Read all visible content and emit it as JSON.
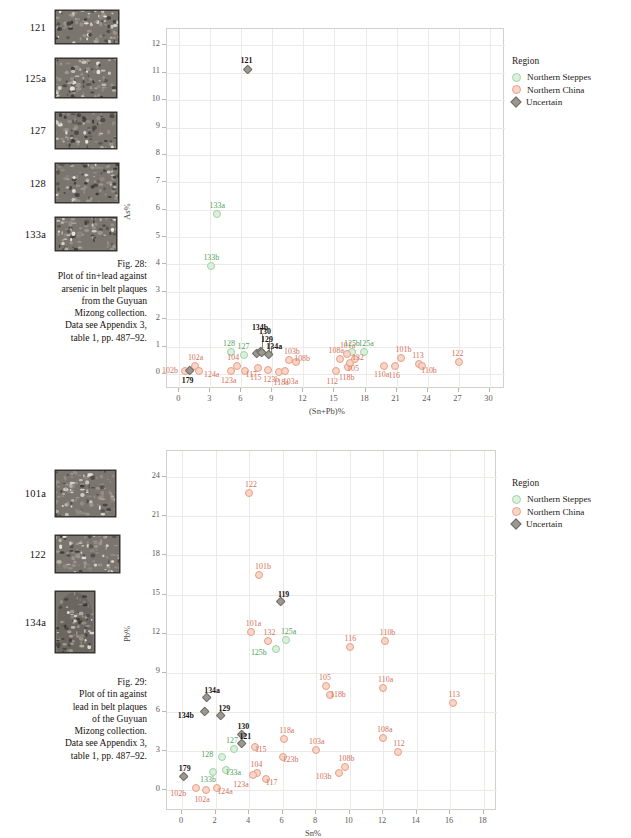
{
  "figures": [
    {
      "id": "fig28",
      "plaques": [
        {
          "id": "121",
          "w": 64,
          "h": 34,
          "shape": "rect"
        },
        {
          "id": "125a",
          "w": 62,
          "h": 40,
          "shape": "rect"
        },
        {
          "id": "127",
          "w": 62,
          "h": 37,
          "shape": "rect"
        },
        {
          "id": "128",
          "w": 64,
          "h": 40,
          "shape": "rect"
        },
        {
          "id": "133a",
          "w": 62,
          "h": 34,
          "shape": "rect"
        }
      ],
      "caption": [
        "Fig. 28:",
        "Plot of tin+lead against",
        "arsenic in belt plaques",
        "from the Guyuan",
        "Mizong collection.",
        "Data see Appendix 3,",
        "table 1, pp. 487–92."
      ],
      "legend": {
        "title": "Region",
        "items": [
          {
            "label": "Northern Steppes",
            "color": "#dcf0dd",
            "border": "#9ed4a5",
            "shape": "circle"
          },
          {
            "label": "Northern China",
            "color": "#f7d5c9",
            "border": "#ea9f85",
            "shape": "circle"
          },
          {
            "label": "Uncertain",
            "color": "#9b9892",
            "border": "#6e6b66",
            "shape": "diamond"
          }
        ]
      },
      "chart_data": {
        "type": "scatter",
        "title": "",
        "xlabel": "(Sn+Pb)%",
        "ylabel": "As%",
        "xlim": [
          -1.2,
          31.5
        ],
        "ylim": [
          -0.55,
          12.6
        ],
        "xticks": [
          0,
          3,
          6,
          9,
          12,
          15,
          18,
          21,
          24,
          27,
          30
        ],
        "yticks": [
          0,
          1,
          2,
          3,
          4,
          5,
          6,
          7,
          8,
          9,
          10,
          11,
          12
        ],
        "grid": true,
        "legend_position": "right",
        "series": [
          {
            "name": "Northern Steppes",
            "color": "#dcf0dd",
            "marker": "circle",
            "points": [
              {
                "label": "133a",
                "x": 3.6,
                "y": 5.85,
                "lx": 0,
                "ly": -10
              },
              {
                "label": "133b",
                "x": 3.1,
                "y": 3.95,
                "lx": -1,
                "ly": -10
              },
              {
                "label": "128",
                "x": 5.0,
                "y": 0.82,
                "lx": -1,
                "ly": -10
              },
              {
                "label": "127",
                "x": 6.2,
                "y": 0.7,
                "lx": 1,
                "ly": -10
              },
              {
                "label": "125b",
                "x": 16.7,
                "y": 0.8,
                "lx": -1,
                "ly": -10
              },
              {
                "label": "125a",
                "x": 17.9,
                "y": 0.82,
                "lx": 1,
                "ly": -10
              }
            ]
          },
          {
            "name": "Northern China",
            "color": "#f7d5c9",
            "marker": "circle",
            "points": [
              {
                "label": "102b",
                "x": 0.55,
                "y": 0.12,
                "lx": -16,
                "ly": -2
              },
              {
                "label": "102a",
                "x": 1.5,
                "y": 0.3,
                "lx": 0,
                "ly": -10
              },
              {
                "label": "124a",
                "x": 1.9,
                "y": 0.12,
                "lx": 12,
                "ly": 2
              },
              {
                "label": "123a",
                "x": 5.0,
                "y": 0.1,
                "lx": -3,
                "ly": 8
              },
              {
                "label": "104",
                "x": 5.6,
                "y": 0.3,
                "lx": -3,
                "ly": -10
              },
              {
                "label": "117",
                "x": 6.3,
                "y": 0.12,
                "lx": 8,
                "ly": 2
              },
              {
                "label": "115",
                "x": 7.6,
                "y": 0.22,
                "lx": -1,
                "ly": 8
              },
              {
                "label": "123b",
                "x": 8.6,
                "y": 0.16,
                "lx": 2,
                "ly": 8
              },
              {
                "label": "118a",
                "x": 9.6,
                "y": 0.06,
                "lx": 2,
                "ly": 9
              },
              {
                "label": "103a",
                "x": 10.2,
                "y": 0.12,
                "lx": 5,
                "ly": 9
              },
              {
                "label": "103b",
                "x": 10.6,
                "y": 0.52,
                "lx": 2,
                "ly": -10
              },
              {
                "label": "108b",
                "x": 11.3,
                "y": 0.42,
                "lx": 5,
                "ly": -5
              },
              {
                "label": "112",
                "x": 15.1,
                "y": 0.1,
                "lx": -2,
                "ly": 9
              },
              {
                "label": "108a",
                "x": 15.5,
                "y": 0.55,
                "lx": -4,
                "ly": -10
              },
              {
                "label": "101a",
                "x": 16.2,
                "y": 0.72,
                "lx": 0,
                "ly": -10
              },
              {
                "label": "118b",
                "x": 16.3,
                "y": 0.25,
                "lx": -2,
                "ly": 9
              },
              {
                "label": "105",
                "x": 16.5,
                "y": 0.4,
                "lx": 4,
                "ly": 4
              },
              {
                "label": "132",
                "x": 17.0,
                "y": 0.55,
                "lx": 4,
                "ly": -3
              },
              {
                "label": "110a",
                "x": 19.8,
                "y": 0.3,
                "lx": -3,
                "ly": 7
              },
              {
                "label": "116",
                "x": 20.9,
                "y": 0.28,
                "lx": 0,
                "ly": 8
              },
              {
                "label": "101b",
                "x": 21.4,
                "y": 0.6,
                "lx": 2,
                "ly": -10
              },
              {
                "label": "113",
                "x": 23.2,
                "y": 0.38,
                "lx": 0,
                "ly": -10
              },
              {
                "label": "110b",
                "x": 23.5,
                "y": 0.3,
                "lx": 6,
                "ly": 3
              },
              {
                "label": "122",
                "x": 27.0,
                "y": 0.45,
                "lx": 0,
                "ly": -10
              }
            ]
          },
          {
            "name": "Uncertain",
            "color": "#9b9892",
            "marker": "diamond",
            "points": [
              {
                "label": "121",
                "x": 6.6,
                "y": 11.1,
                "lx": 0,
                "ly": -11
              },
              {
                "label": "179",
                "x": 1.0,
                "y": 0.1,
                "lx": -1,
                "ly": 8
              },
              {
                "label": "134b",
                "x": 7.5,
                "y": 0.72,
                "lx": 2,
                "ly": -28,
                "leader": 18
              },
              {
                "label": "130",
                "x": 7.9,
                "y": 0.8,
                "lx": 5,
                "ly": -22,
                "leader": 13
              },
              {
                "label": "129",
                "x": 8.0,
                "y": 0.76,
                "lx": 6,
                "ly": -15,
                "leader": 7
              },
              {
                "label": "134a",
                "x": 8.7,
                "y": 0.7,
                "lx": 4,
                "ly": -10
              }
            ]
          }
        ]
      }
    },
    {
      "id": "fig29",
      "plaques": [
        {
          "id": "101a",
          "w": 61,
          "h": 47,
          "shape": "rect"
        },
        {
          "id": "122",
          "w": 65,
          "h": 38,
          "shape": "rect"
        },
        {
          "id": "134a",
          "w": 40,
          "h": 62,
          "shape": "arch"
        }
      ],
      "caption": [
        "Fig. 29:",
        "Plot of tin against",
        "lead in belt plaques",
        "of the Guyuan",
        "Mizong collection.",
        "Data see Appendix 3,",
        "table 1, pp. 487–92."
      ],
      "legend": {
        "title": "Region",
        "items": [
          {
            "label": "Northern Steppes",
            "color": "#dcf0dd",
            "border": "#9ed4a5",
            "shape": "circle"
          },
          {
            "label": "Northern China",
            "color": "#f7d5c9",
            "border": "#ea9f85",
            "shape": "circle"
          },
          {
            "label": "Uncertain",
            "color": "#9b9892",
            "border": "#6e6b66",
            "shape": "diamond"
          }
        ]
      },
      "chart_data": {
        "type": "scatter",
        "title": "",
        "xlabel": "Sn%",
        "ylabel": "Pb%",
        "xlim": [
          -0.9,
          18.8
        ],
        "ylim": [
          -1.6,
          26.0
        ],
        "xticks": [
          0,
          2,
          4,
          6,
          8,
          10,
          12,
          14,
          16,
          18
        ],
        "yticks": [
          0,
          3,
          6,
          9,
          12,
          15,
          18,
          21,
          24
        ],
        "grid": true,
        "legend_position": "right",
        "series": [
          {
            "name": "Northern Steppes",
            "color": "#dcf0dd",
            "marker": "circle",
            "points": [
              {
                "label": "125a",
                "x": 6.2,
                "y": 11.5,
                "lx": 2,
                "ly": -10
              },
              {
                "label": "125b",
                "x": 5.6,
                "y": 10.8,
                "lx": -18,
                "ly": 2
              },
              {
                "label": "127",
                "x": 3.1,
                "y": 3.15,
                "lx": -1,
                "ly": -10
              },
              {
                "label": "128",
                "x": 2.4,
                "y": 2.55,
                "lx": -14,
                "ly": -4
              },
              {
                "label": "133a",
                "x": 2.6,
                "y": 1.55,
                "lx": 7,
                "ly": 1
              },
              {
                "label": "133b",
                "x": 1.85,
                "y": 1.4,
                "lx": -6,
                "ly": 6
              }
            ]
          },
          {
            "name": "Northern China",
            "color": "#f7d5c9",
            "marker": "circle",
            "points": [
              {
                "label": "122",
                "x": 4.0,
                "y": 22.8,
                "lx": 3,
                "ly": -10
              },
              {
                "label": "101b",
                "x": 4.6,
                "y": 16.5,
                "lx": 3,
                "ly": -10
              },
              {
                "label": "101a",
                "x": 4.1,
                "y": 12.1,
                "lx": 2,
                "ly": -10
              },
              {
                "label": "132",
                "x": 5.1,
                "y": 11.4,
                "lx": 3,
                "ly": -10
              },
              {
                "label": "116",
                "x": 10.0,
                "y": 11.0,
                "lx": 2,
                "ly": -10
              },
              {
                "label": "110b",
                "x": 12.1,
                "y": 11.4,
                "lx": 2,
                "ly": -10
              },
              {
                "label": "105",
                "x": 8.6,
                "y": 8.0,
                "lx": 0,
                "ly": -10
              },
              {
                "label": "118b",
                "x": 8.85,
                "y": 7.3,
                "lx": 7,
                "ly": -2
              },
              {
                "label": "110a",
                "x": 12.0,
                "y": 7.8,
                "lx": 2,
                "ly": -10
              },
              {
                "label": "113",
                "x": 16.2,
                "y": 6.7,
                "lx": 2,
                "ly": -10
              },
              {
                "label": "118a",
                "x": 6.1,
                "y": 3.95,
                "lx": 2,
                "ly": -10
              },
              {
                "label": "103a",
                "x": 8.0,
                "y": 3.05,
                "lx": 0,
                "ly": -10
              },
              {
                "label": "108a",
                "x": 12.0,
                "y": 4.0,
                "lx": 1,
                "ly": -10
              },
              {
                "label": "112",
                "x": 12.9,
                "y": 2.9,
                "lx": 2,
                "ly": -10
              },
              {
                "label": "115",
                "x": 4.35,
                "y": 3.3,
                "lx": 7,
                "ly": 1
              },
              {
                "label": "123b",
                "x": 6.0,
                "y": 2.55,
                "lx": 7,
                "ly": 1
              },
              {
                "label": "108b",
                "x": 9.7,
                "y": 1.8,
                "lx": 1,
                "ly": -10
              },
              {
                "label": "103b",
                "x": 9.35,
                "y": 1.3,
                "lx": -16,
                "ly": 2
              },
              {
                "label": "104",
                "x": 4.45,
                "y": 1.3,
                "lx": 1,
                "ly": -10
              },
              {
                "label": "123a",
                "x": 4.25,
                "y": 1.2,
                "lx": -13,
                "ly": 8
              },
              {
                "label": "117",
                "x": 5.0,
                "y": 0.85,
                "lx": 7,
                "ly": 2
              },
              {
                "label": "124a",
                "x": 2.1,
                "y": 0.15,
                "lx": 7,
                "ly": 2
              },
              {
                "label": "102b",
                "x": 0.85,
                "y": 0.15,
                "lx": -19,
                "ly": 4
              },
              {
                "label": "102a",
                "x": 1.45,
                "y": 0.05,
                "lx": -5,
                "ly": 8
              }
            ]
          },
          {
            "name": "Uncertain",
            "color": "#9b9892",
            "marker": "diamond",
            "points": [
              {
                "label": "119",
                "x": 5.9,
                "y": 14.4,
                "lx": 4,
                "ly": -9
              },
              {
                "label": "134a",
                "x": 1.5,
                "y": 7.1,
                "lx": 4,
                "ly": -9
              },
              {
                "label": "134b",
                "x": 1.35,
                "y": 6.0,
                "lx": -20,
                "ly": 2
              },
              {
                "label": "129",
                "x": 2.35,
                "y": 5.7,
                "lx": 4,
                "ly": -9
              },
              {
                "label": "130",
                "x": 3.6,
                "y": 4.2,
                "lx": 2,
                "ly": -10
              },
              {
                "label": "121",
                "x": 3.6,
                "y": 3.55,
                "lx": 4,
                "ly": -9
              },
              {
                "label": "179",
                "x": 0.1,
                "y": 1.0,
                "lx": 2,
                "ly": -10
              }
            ]
          }
        ]
      }
    }
  ]
}
